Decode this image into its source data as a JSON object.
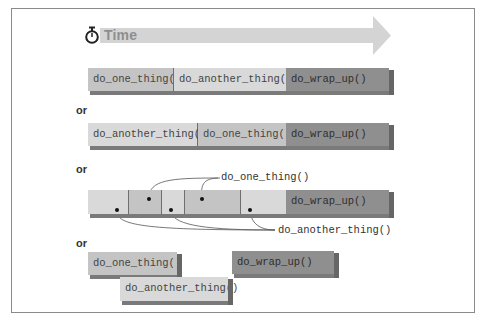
{
  "header": {
    "icon": "stopwatch-icon",
    "title": "Time"
  },
  "separator_label": "or",
  "colors": {
    "light": "#d9d9d9",
    "mid": "#c4c4c4",
    "dark": "#8f8f8f",
    "arrow": "#d4d4d4",
    "frame": "#8a8a8a"
  },
  "scenarios": [
    {
      "name": "sequential-one-first",
      "segments": [
        {
          "label": "do_one_thing()",
          "shade": "mid"
        },
        {
          "label": "do_another_thing()",
          "shade": "light"
        },
        {
          "label": "do_wrap_up()",
          "shade": "dark"
        }
      ]
    },
    {
      "name": "sequential-another-first",
      "segments": [
        {
          "label": "do_another_thing()",
          "shade": "light"
        },
        {
          "label": "do_one_thing()",
          "shade": "mid"
        },
        {
          "label": "do_wrap_up()",
          "shade": "dark"
        }
      ]
    },
    {
      "name": "interleaved",
      "segments": [
        {
          "label": "",
          "shade": "light",
          "task": "do_another_thing"
        },
        {
          "label": "",
          "shade": "mid",
          "task": "do_one_thing"
        },
        {
          "label": "",
          "shade": "light",
          "task": "do_another_thing"
        },
        {
          "label": "",
          "shade": "mid",
          "task": "do_one_thing"
        },
        {
          "label": "",
          "shade": "light",
          "task": "do_another_thing"
        },
        {
          "label": "do_wrap_up()",
          "shade": "dark"
        }
      ],
      "callouts": {
        "top": "do_one_thing()",
        "bottom": "do_another_thing()"
      }
    },
    {
      "name": "parallel",
      "segments": [
        {
          "label": "do_one_thing()",
          "shade": "mid"
        },
        {
          "label": "do_another_thing()",
          "shade": "light"
        },
        {
          "label": "do_wrap_up()",
          "shade": "dark"
        }
      ]
    }
  ]
}
